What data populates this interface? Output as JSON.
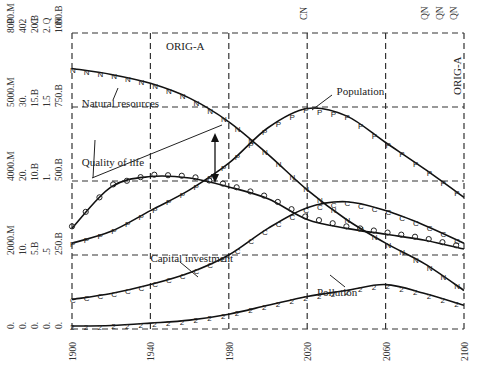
{
  "chart_data": {
    "type": "line",
    "title": "",
    "xlabel": "",
    "ylabel": "",
    "x": [
      1900,
      1920,
      1940,
      1960,
      1980,
      2000,
      2020,
      2040,
      2060,
      2080,
      2100
    ],
    "x_ticks": [
      "1900",
      "1940",
      "1980",
      "2020",
      "2060",
      "2100"
    ],
    "xlim": [
      1900,
      2100
    ],
    "ylim": [
      0,
      1000
    ],
    "grid": true,
    "scenario_label": "ORIG-A",
    "right_label": "ORIG-A",
    "top_markers": [
      "CN",
      "QN",
      "QN",
      "QN"
    ],
    "y_axes": [
      {
        "key": "P",
        "ticks": [
          "0.",
          "2000.M",
          "4000.M",
          "5000.M",
          "8000.M"
        ]
      },
      {
        "key": "2",
        "ticks": [
          "0.",
          "10.",
          "20.",
          "30.",
          "40."
        ]
      },
      {
        "key": "C",
        "ticks": [
          "0.",
          "5.B",
          "10.B",
          "15.B",
          "20.B"
        ]
      },
      {
        "key": "Q",
        "ticks": [
          "0.",
          ".5",
          "1.",
          "1.5",
          "2."
        ]
      },
      {
        "key": "N",
        "ticks": [
          "0.",
          "250.B",
          "500.B",
          "750.B",
          "1000.B"
        ]
      }
    ],
    "series": [
      {
        "name": "Natural resources",
        "marker": "N",
        "values": [
          880,
          860,
          830,
          780,
          700,
          590,
          470,
          370,
          290,
          220,
          130
        ]
      },
      {
        "name": "Population",
        "marker": "P",
        "values": [
          290,
          330,
          400,
          470,
          560,
          680,
          745,
          720,
          630,
          540,
          445
        ]
      },
      {
        "name": "Quality of life",
        "marker": "Q",
        "values": [
          340,
          480,
          515,
          510,
          480,
          440,
          370,
          340,
          320,
          300,
          270
        ]
      },
      {
        "name": "Capital investment",
        "marker": "C",
        "values": [
          100,
          120,
          150,
          190,
          250,
          340,
          410,
          430,
          400,
          350,
          290
        ]
      },
      {
        "name": "Pollution",
        "marker": "2",
        "values": [
          10,
          12,
          20,
          30,
          50,
          80,
          110,
          130,
          150,
          120,
          80
        ]
      }
    ],
    "annotations": [
      {
        "text": "Natural resources",
        "x": 1905,
        "y": 750
      },
      {
        "text": "Quality of life",
        "x": 1905,
        "y": 550
      },
      {
        "text": "Population",
        "x": 2035,
        "y": 790
      },
      {
        "text": "Capital investment",
        "x": 1940,
        "y": 225
      },
      {
        "text": "Pollution",
        "x": 2025,
        "y": 110
      }
    ]
  }
}
